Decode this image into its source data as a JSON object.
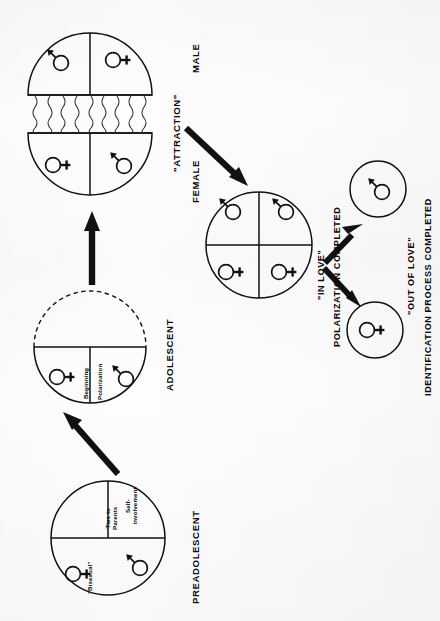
{
  "diagram": {
    "title_visible": false,
    "stages": [
      {
        "id": "preadolescent",
        "label": "PREADOLESCENT",
        "quadrant_labels": [
          "Ties to Parents",
          "Self-involvement",
          "\"Bisexual\""
        ],
        "symbols": [
          "male-symbol",
          "female-symbol"
        ]
      },
      {
        "id": "adolescent",
        "label": "ADOLESCENT",
        "quadrant_labels": [
          "Beginning",
          "Polarization"
        ],
        "symbols": [
          "female-symbol",
          "male-symbol"
        ]
      },
      {
        "id": "attraction",
        "label": "\"ATTRACTION\"",
        "sublabel_male": "MALE",
        "sublabel_female": "FEMALE",
        "symbols": [
          "male-symbol",
          "female-symbol",
          "female-symbol",
          "male-symbol"
        ]
      },
      {
        "id": "in-love",
        "label": "\"IN LOVE\"",
        "sublabel": "POLARIZATION COMPLETED",
        "symbols": [
          "male-symbol",
          "male-symbol",
          "female-symbol",
          "female-symbol"
        ]
      },
      {
        "id": "out-of-love",
        "label": "\"OUT OF LOVE\"",
        "sublabel": "IDENTIFICATION PROCESS COMPLETED",
        "symbols": [
          "male-symbol",
          "female-symbol"
        ]
      }
    ],
    "arrows": [
      {
        "id": "preadolescent-to-adolescent",
        "kind": "thick-diagonal-up"
      },
      {
        "id": "adolescent-to-attraction",
        "kind": "thick-vertical-up"
      },
      {
        "id": "attraction-to-in-love",
        "kind": "thick-diagonal-down"
      },
      {
        "id": "in-love-to-male-result",
        "kind": "thick-diagonal-up"
      },
      {
        "id": "in-love-to-female-result",
        "kind": "thick-diagonal-down"
      }
    ],
    "colors": {
      "ink": "#0a0a0a",
      "line": "#1a1a1a",
      "paper": "#fdfdfd"
    }
  }
}
